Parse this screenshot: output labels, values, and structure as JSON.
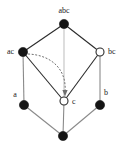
{
  "diagram": {
    "type": "hasse-lattice",
    "title": "",
    "background_color": "#ffffff",
    "canvas": {
      "width": 125,
      "height": 154
    },
    "colors": {
      "node_filled": "#141414",
      "node_open_fill": "#ffffff",
      "node_stroke": "#2b2b2b",
      "edge_dark": "#2b2b2b",
      "edge_mid": "#8a8a8a",
      "edge_light": "#c2c2c2",
      "arc_dashed": "#6f6f6f",
      "label": "#1a1a1a"
    },
    "nodes": [
      {
        "id": "abc",
        "label": "abc",
        "x": 64,
        "y": 24,
        "r": 4.6,
        "style": "filled",
        "label_x": 64,
        "label_y": 11,
        "label_anchor": "middle"
      },
      {
        "id": "ac",
        "label": "ac",
        "x": 23,
        "y": 52,
        "r": 4.6,
        "style": "filled",
        "label_x": 14,
        "label_y": 52,
        "label_anchor": "end"
      },
      {
        "id": "bc",
        "label": "bc",
        "x": 100,
        "y": 52,
        "r": 4.0,
        "style": "open",
        "label_x": 108,
        "label_y": 52,
        "label_anchor": "start"
      },
      {
        "id": "a",
        "label": "a",
        "x": 24,
        "y": 105,
        "r": 4.6,
        "style": "filled",
        "label_x": 15,
        "label_y": 95,
        "label_anchor": "middle"
      },
      {
        "id": "c",
        "label": "c",
        "x": 64,
        "y": 101,
        "r": 4.0,
        "style": "open",
        "label_x": 72,
        "label_y": 102,
        "label_anchor": "start"
      },
      {
        "id": "b",
        "label": "b",
        "x": 100,
        "y": 105,
        "r": 4.6,
        "style": "filled",
        "label_x": 106,
        "label_y": 93,
        "label_anchor": "middle"
      },
      {
        "id": "bottom",
        "label": "",
        "x": 63,
        "y": 136,
        "r": 4.6,
        "style": "filled",
        "label_x": 63,
        "label_y": 149,
        "label_anchor": "middle"
      }
    ],
    "edges": [
      {
        "from": "abc",
        "to": "ac",
        "tone": "dark"
      },
      {
        "from": "abc",
        "to": "bc",
        "tone": "dark"
      },
      {
        "from": "abc",
        "to": "c",
        "tone": "light"
      },
      {
        "from": "ac",
        "to": "a",
        "tone": "mid"
      },
      {
        "from": "ac",
        "to": "c",
        "tone": "dark"
      },
      {
        "from": "bc",
        "to": "b",
        "tone": "mid"
      },
      {
        "from": "bc",
        "to": "c",
        "tone": "dark"
      },
      {
        "from": "a",
        "to": "bottom",
        "tone": "mid"
      },
      {
        "from": "c",
        "to": "bottom",
        "tone": "mid"
      },
      {
        "from": "b",
        "to": "bottom",
        "tone": "mid"
      }
    ],
    "annotation_arc": {
      "name": "dashed-arrow-ac-to-c",
      "from": "ac",
      "to": "c",
      "style": "dashed-curved-arrow",
      "path": "M 28 54 C 52 55, 67 70, 65 92",
      "arrowhead_points": "62.4,90 67.6,90 65,96.5"
    }
  }
}
